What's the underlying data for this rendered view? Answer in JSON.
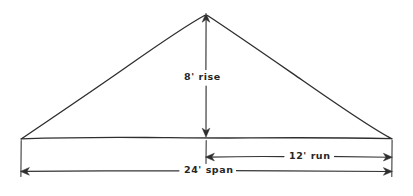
{
  "figure": {
    "kind": "hand-drawn roof framing sketch",
    "shape": "isosceles triangle (gable roof profile)",
    "background_color": "#ffffff",
    "ink_color": "#2e2e2e"
  },
  "dimensions": {
    "rise": {
      "label": "8' rise",
      "value": 8,
      "unit": "ft",
      "orientation": "vertical",
      "arrow_style": "double-headed"
    },
    "run": {
      "label": "12' run",
      "value": 12,
      "unit": "ft",
      "orientation": "horizontal",
      "arrow_style": "double-headed"
    },
    "span": {
      "label": "24' span",
      "value": 24,
      "unit": "ft",
      "orientation": "horizontal",
      "arrow_style": "double-headed"
    }
  },
  "geometry": {
    "apex": {
      "x": 206,
      "y": 14
    },
    "left_vertex": {
      "x": 21,
      "y": 139
    },
    "right_vertex": {
      "x": 392,
      "y": 139
    },
    "rise_line_x": 206,
    "run_dim_y": 157,
    "span_dim_y": 171
  }
}
